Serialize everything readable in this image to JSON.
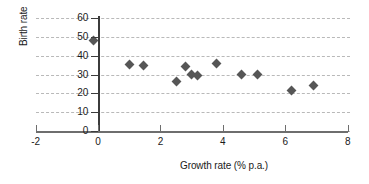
{
  "chart_data": {
    "type": "scatter",
    "title": "",
    "xlabel": "Growth rate (% p.a.)",
    "ylabel": "Birth rate",
    "xlim": [
      -2,
      8
    ],
    "ylim": [
      0,
      60
    ],
    "xticks": [
      "-2",
      "0",
      "2",
      "4",
      "6",
      "8"
    ],
    "xtick_values": [
      -2,
      0,
      2,
      4,
      6,
      8
    ],
    "yticks": [
      "0",
      "10",
      "20",
      "30",
      "40",
      "50",
      "60"
    ],
    "ytick_values": [
      0,
      10,
      20,
      30,
      40,
      50,
      60
    ],
    "grid": "horizontal-dashed",
    "legend": "none",
    "marker": "diamond",
    "marker_color": "#565656",
    "points": [
      {
        "x": -0.15,
        "y": 48.0
      },
      {
        "x": 1.0,
        "y": 35.5
      },
      {
        "x": 1.45,
        "y": 35.0
      },
      {
        "x": 2.5,
        "y": 26.5
      },
      {
        "x": 2.8,
        "y": 34.0
      },
      {
        "x": 3.0,
        "y": 30.0
      },
      {
        "x": 3.2,
        "y": 29.5
      },
      {
        "x": 3.8,
        "y": 36.0
      },
      {
        "x": 4.6,
        "y": 30.0
      },
      {
        "x": 5.1,
        "y": 30.0
      },
      {
        "x": 6.2,
        "y": 21.5
      },
      {
        "x": 6.9,
        "y": 24.0
      }
    ]
  }
}
